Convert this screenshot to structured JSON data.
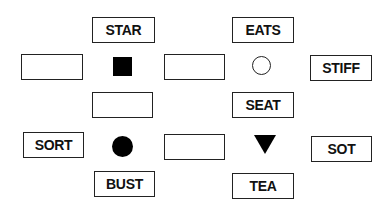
{
  "puzzle": {
    "boxes": [
      {
        "id": "star",
        "label": "STAR",
        "x": 92,
        "y": 17,
        "w": 63,
        "h": 26
      },
      {
        "id": "blank-left-top",
        "label": "",
        "x": 21,
        "y": 54,
        "w": 62,
        "h": 26
      },
      {
        "id": "blank-mid-top",
        "label": "",
        "x": 164,
        "y": 54,
        "w": 61,
        "h": 26
      },
      {
        "id": "eats",
        "label": "EATS",
        "x": 232,
        "y": 17,
        "w": 62,
        "h": 26
      },
      {
        "id": "stiff",
        "label": "STIFF",
        "x": 310,
        "y": 55,
        "w": 62,
        "h": 26
      },
      {
        "id": "blank-under-square",
        "label": "",
        "x": 92,
        "y": 92,
        "w": 61,
        "h": 26
      },
      {
        "id": "seat",
        "label": "SEAT",
        "x": 232,
        "y": 92,
        "w": 62,
        "h": 26
      },
      {
        "id": "sort",
        "label": "SORT",
        "x": 23,
        "y": 132,
        "w": 61,
        "h": 26
      },
      {
        "id": "blank-mid-bottom",
        "label": "",
        "x": 164,
        "y": 134,
        "w": 61,
        "h": 26
      },
      {
        "id": "sot",
        "label": "SOT",
        "x": 311,
        "y": 136,
        "w": 61,
        "h": 26
      },
      {
        "id": "bust",
        "label": "BUST",
        "x": 94,
        "y": 171,
        "w": 61,
        "h": 26
      },
      {
        "id": "tea",
        "label": "TEA",
        "x": 232,
        "y": 173,
        "w": 62,
        "h": 26
      }
    ],
    "symbols": [
      {
        "id": "filled-square",
        "shape": "square",
        "fill": "#000000"
      },
      {
        "id": "hollow-circle",
        "shape": "circle",
        "fill": "none"
      },
      {
        "id": "filled-circle",
        "shape": "circle",
        "fill": "#000000"
      },
      {
        "id": "filled-triangle",
        "shape": "triangle-down",
        "fill": "#000000"
      }
    ]
  }
}
